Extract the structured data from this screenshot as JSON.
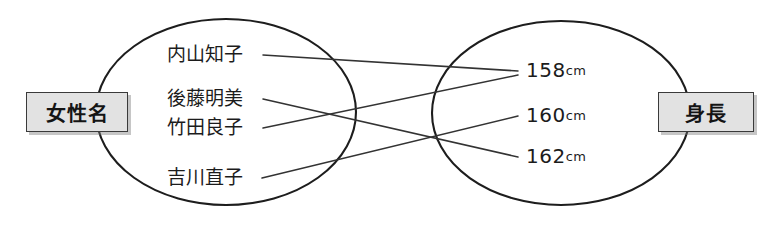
{
  "diagram": {
    "type": "set-mapping-diagram",
    "left_set": {
      "label": "女性名",
      "members": [
        {
          "label": "内山知子"
        },
        {
          "label": "後藤明美"
        },
        {
          "label": "竹田良子"
        },
        {
          "label": "吉川直子"
        }
      ]
    },
    "right_set": {
      "label": "身長",
      "members": [
        {
          "value": "158",
          "unit": "cm"
        },
        {
          "value": "160",
          "unit": "cm"
        },
        {
          "value": "162",
          "unit": "cm"
        }
      ]
    },
    "mappings": [
      {
        "from": "内山知子",
        "to": "158cm"
      },
      {
        "from": "後藤明美",
        "to": "162cm"
      },
      {
        "from": "竹田良子",
        "to": "158cm"
      },
      {
        "from": "吉川直子",
        "to": "160cm"
      }
    ],
    "colors": {
      "ink": "#1d1d1d",
      "line": "#333333",
      "label_fill": "#e2e2e2",
      "label_border": "#3a3a3a",
      "background": "#ffffff"
    }
  }
}
